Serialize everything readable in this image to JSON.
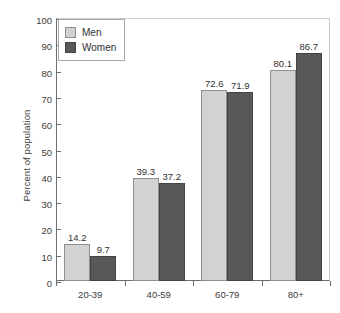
{
  "chart_data": {
    "type": "bar",
    "title": "",
    "xlabel": "",
    "ylabel": "Percent of population",
    "categories": [
      "20-39",
      "40-59",
      "60-79",
      "80+"
    ],
    "series": [
      {
        "name": "Men",
        "color": "#d2d2d2",
        "values": [
          14.2,
          39.3,
          72.6,
          80.1
        ]
      },
      {
        "name": "Women",
        "color": "#58585a",
        "values": [
          9.7,
          37.2,
          71.9,
          86.7
        ]
      }
    ],
    "ylim": [
      0,
      100
    ],
    "yticks": [
      0,
      10,
      20,
      30,
      40,
      50,
      60,
      70,
      80,
      90,
      100
    ],
    "ytick_labels": [
      "0",
      "10",
      "20",
      "30",
      "40",
      "50",
      "60",
      "70",
      "80",
      "90",
      "100"
    ],
    "grid": false,
    "legend_position": "top-left",
    "value_labels": [
      [
        "14.2",
        "9.7"
      ],
      [
        "39.3",
        "37.2"
      ],
      [
        "72.6",
        "71.9"
      ],
      [
        "80.1",
        "86.7"
      ]
    ]
  }
}
